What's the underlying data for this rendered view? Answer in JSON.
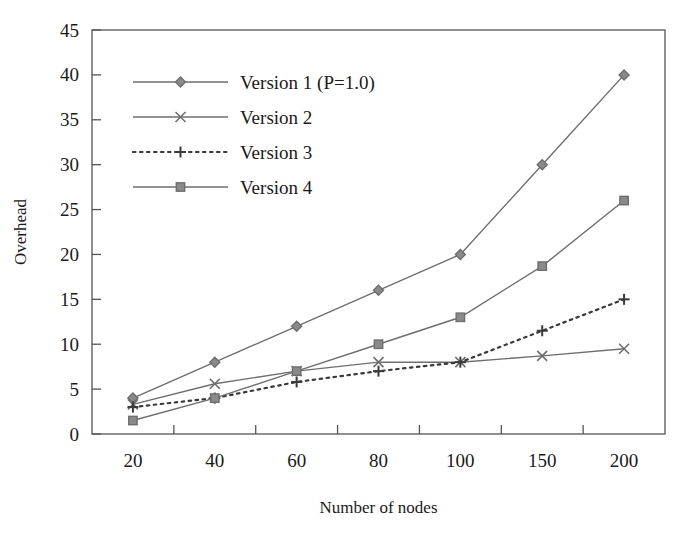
{
  "chart_data": {
    "type": "line",
    "title": "",
    "xlabel": "Number of nodes",
    "ylabel": "Overhead",
    "categories": [
      "20",
      "40",
      "60",
      "80",
      "100",
      "150",
      "200"
    ],
    "x_tick_labels": [
      "20",
      "40",
      "60",
      "80",
      "100",
      "150",
      "200"
    ],
    "y_tick_labels": [
      "0",
      "5",
      "10",
      "15",
      "20",
      "25",
      "30",
      "35",
      "40",
      "45"
    ],
    "ylim": [
      0,
      45
    ],
    "y_tick_step": 5,
    "grid": false,
    "legend_position": "upper-left-inside",
    "series": [
      {
        "name": "Version 1 (P=1.0)",
        "marker": "diamond",
        "line_style": "solid",
        "color": "#6e6e6e",
        "values": [
          4,
          8,
          12,
          16,
          20,
          30,
          40
        ]
      },
      {
        "name": "Version 2",
        "marker": "cross",
        "line_style": "solid",
        "color": "#6e6e6e",
        "values": [
          3.3,
          5.6,
          7,
          8,
          8,
          8.7,
          9.5
        ]
      },
      {
        "name": "Version 3",
        "marker": "plus",
        "line_style": "dotted",
        "color": "#3a3a3a",
        "values": [
          3,
          4,
          5.8,
          7,
          8,
          11.5,
          15
        ]
      },
      {
        "name": "Version 4",
        "marker": "square",
        "line_style": "solid",
        "color": "#6e6e6e",
        "values": [
          1.5,
          4,
          7,
          10,
          13,
          18.7,
          26
        ]
      }
    ]
  },
  "legend": {
    "entries": [
      {
        "label": "Version 1 (P=1.0)"
      },
      {
        "label": "Version 2"
      },
      {
        "label": "Version 3"
      },
      {
        "label": "Version 4"
      }
    ]
  },
  "axes": {
    "x_title": "Number of nodes",
    "y_title": "Overhead"
  }
}
